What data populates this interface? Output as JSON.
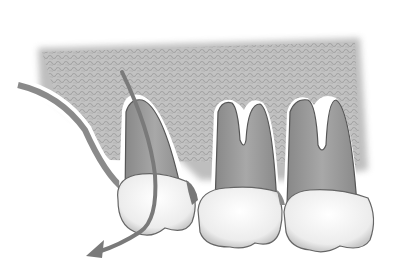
{
  "image": {
    "kind": "dental-illustration",
    "description": "Three upper molars embedded in gray textured bone; curved arrow through the left tooth indicating extraction direction",
    "width": 401,
    "height": 269
  },
  "colors": {
    "bone": "#b8b8b8",
    "bone_dark": "#9a9a9a",
    "root": "#9c9c9c",
    "root_dark": "#6e6e6e",
    "crown": "#f4f4f4",
    "outline": "#555555",
    "arrow": "#7a7a7a",
    "gum": "#8e8e8e"
  },
  "elements": {
    "teeth_count": 3,
    "arrow": "curved-extraction-arrow"
  }
}
